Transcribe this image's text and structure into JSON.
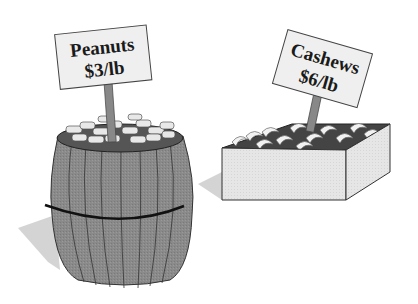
{
  "illustration": {
    "items": [
      {
        "name": "Peanuts",
        "price": "$3/lb",
        "container": "barrel"
      },
      {
        "name": "Cashews",
        "price": "$6/lb",
        "container": "box"
      }
    ]
  }
}
